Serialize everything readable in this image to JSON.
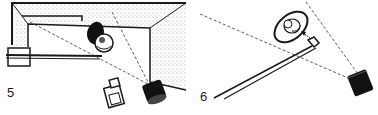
{
  "figures": [
    {
      "number": "5",
      "subject": "room lighting setup viewed from above",
      "elements": [
        "room-walls",
        "wall-shadow",
        "subject-head",
        "subject-shadow",
        "boom-pole",
        "tripod-camera",
        "spotlight",
        "light-beam-lines"
      ]
    },
    {
      "number": "6",
      "subject": "boom light aimed at subject",
      "elements": [
        "reflector-dish",
        "subject-head",
        "boom-pole",
        "light-head",
        "spotlight",
        "light-beam-lines",
        "direction-arrow"
      ]
    }
  ],
  "colors": {
    "ink": "#1a1a1a",
    "paper": "#ffffff",
    "stipple": "#9a9a9a"
  }
}
